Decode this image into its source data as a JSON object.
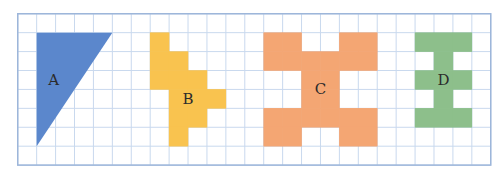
{
  "grid": {
    "cols": 25,
    "rows": 8,
    "cell": 18.92,
    "line_color": "#c9d9ee",
    "border_color": "#9db6da"
  },
  "shapes": [
    {
      "id": "A",
      "label": "A",
      "color": "#5b87cc",
      "type": "triangle",
      "points": [
        [
          1,
          1
        ],
        [
          5,
          1
        ],
        [
          1,
          7
        ]
      ],
      "label_pos": [
        1.9,
        3.5
      ]
    },
    {
      "id": "B",
      "label": "B",
      "color": "#f9c34f",
      "type": "cells",
      "cells": [
        [
          7,
          1
        ],
        [
          7,
          2
        ],
        [
          8,
          2
        ],
        [
          7,
          3
        ],
        [
          8,
          3
        ],
        [
          9,
          3
        ],
        [
          8,
          4
        ],
        [
          9,
          4
        ],
        [
          10,
          4
        ],
        [
          8,
          5
        ],
        [
          9,
          5
        ],
        [
          8,
          6
        ]
      ],
      "label_pos": [
        9,
        4.5
      ]
    },
    {
      "id": "C",
      "label": "C",
      "color": "#f4a673",
      "type": "cells",
      "cells": [
        [
          13,
          1
        ],
        [
          14,
          1
        ],
        [
          17,
          1
        ],
        [
          18,
          1
        ],
        [
          13,
          2
        ],
        [
          14,
          2
        ],
        [
          15,
          2
        ],
        [
          16,
          2
        ],
        [
          17,
          2
        ],
        [
          18,
          2
        ],
        [
          15,
          3
        ],
        [
          16,
          3
        ],
        [
          15,
          4
        ],
        [
          16,
          4
        ],
        [
          13,
          5
        ],
        [
          14,
          5
        ],
        [
          15,
          5
        ],
        [
          16,
          5
        ],
        [
          17,
          5
        ],
        [
          18,
          5
        ],
        [
          13,
          6
        ],
        [
          14,
          6
        ],
        [
          17,
          6
        ],
        [
          18,
          6
        ]
      ],
      "label_pos": [
        16,
        4
      ]
    },
    {
      "id": "D",
      "label": "D",
      "color": "#8dbf8b",
      "type": "cells",
      "cells": [
        [
          21,
          1
        ],
        [
          22,
          1
        ],
        [
          23,
          1
        ],
        [
          22,
          2
        ],
        [
          21,
          3
        ],
        [
          22,
          3
        ],
        [
          23,
          3
        ],
        [
          22,
          4
        ],
        [
          21,
          5
        ],
        [
          22,
          5
        ],
        [
          23,
          5
        ]
      ],
      "label_pos": [
        22.5,
        3.5
      ]
    }
  ]
}
